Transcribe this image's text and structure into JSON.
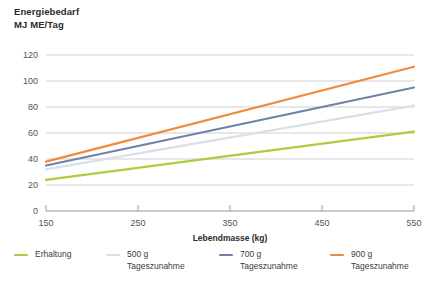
{
  "chart_data": {
    "type": "line",
    "title": "Energiebedarf MJ ME/Tag",
    "title_lines": [
      "Energiebedarf",
      "MJ ME/Tag"
    ],
    "xlabel": "Lebendmasse (kg)",
    "ylabel": "",
    "xlim": [
      150,
      550
    ],
    "ylim": [
      0,
      120
    ],
    "xticks": [
      150,
      250,
      350,
      450,
      550
    ],
    "yticks": [
      0,
      20,
      40,
      60,
      80,
      100,
      120
    ],
    "xtick_labels": [
      "150",
      "250",
      "350",
      "450",
      "550"
    ],
    "ytick_labels": [
      "0",
      "20",
      "40",
      "60",
      "80",
      "100",
      "120"
    ],
    "grid": "horizontal",
    "legend_position": "bottom",
    "x": [
      150,
      550
    ],
    "series": [
      {
        "name": "Erhaltung",
        "label_lines": [
          "Erhaltung"
        ],
        "color": "#a9ce3e",
        "values": [
          24,
          61
        ]
      },
      {
        "name": "500 g Tageszunahme",
        "label_lines": [
          "500 g",
          "Tageszunahme"
        ],
        "color": "#d8e1ea",
        "values": [
          32,
          81
        ]
      },
      {
        "name": "700 g Tageszunahme",
        "label_lines": [
          "700 g",
          "Tageszunahme"
        ],
        "color": "#6f82a9",
        "values": [
          35,
          95
        ]
      },
      {
        "name": "900 g Tageszunahme",
        "label_lines": [
          "900 g",
          "Tageszunahme"
        ],
        "color": "#f08a3c",
        "values": [
          38,
          111
        ]
      }
    ]
  },
  "legend": {
    "items": [
      {
        "label_line1": "Erhaltung",
        "label_line2": "",
        "color": "#a9ce3e",
        "left": 14
      },
      {
        "label_line1": "500 g",
        "label_line2": "Tageszunahme",
        "color": "#d8e1ea",
        "left": 106
      },
      {
        "label_line1": "700 g",
        "label_line2": "Tageszunahme",
        "color": "#6f82a9",
        "left": 219
      },
      {
        "label_line1": "900 g",
        "label_line2": "Tageszunahme",
        "color": "#f08a3c",
        "left": 330
      }
    ]
  },
  "axes": {
    "y_tick_0": "0",
    "y_tick_20": "20",
    "y_tick_40": "40",
    "y_tick_60": "60",
    "y_tick_80": "80",
    "y_tick_100": "100",
    "y_tick_120": "120",
    "x_tick_150": "150",
    "x_tick_250": "250",
    "x_tick_350": "350",
    "x_tick_450": "450",
    "x_tick_550": "550",
    "x_axis_title": "Lebendmasse (kg)"
  },
  "title": {
    "line1": "Energiebedarf",
    "line2": "MJ ME/Tag"
  },
  "colors": {
    "grid": "#cfcfcf",
    "axis": "#9a9a9a",
    "text": "#3c3c3c"
  }
}
